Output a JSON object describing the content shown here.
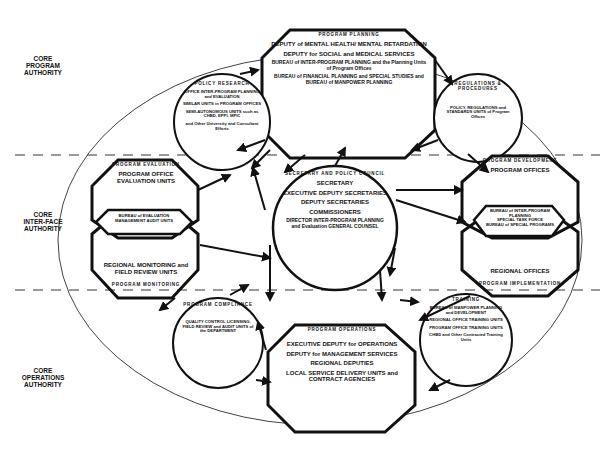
{
  "title": "",
  "zones": [
    {
      "label": "CORE\nPROGRAM\nAUTHORITY"
    },
    {
      "label": "CORE\nINTER-FACE\nAUTHORITY"
    },
    {
      "label": "CORE\nOPERATIONS\nAUTHORITY"
    }
  ],
  "nodes": {
    "program_planning": {
      "header": "PROGRAM PLANNING",
      "items": [
        "DEPUTY of MENTAL HEALTH/ MENTAL RETARDATION",
        "DEPUTY for SOCIAL and MEDICAL SERVICES",
        "BUREAU of INTER-PROGRAM PLANNING and the Planning Units of Program Offices",
        "BUREAU of FINANCIAL PLANNING and SPECIAL STUDIES and BUREAU of MANPOWER PLANNING"
      ]
    },
    "policy_research": {
      "header": "POLICY RESEARCH",
      "items": [
        "OFFICE INTER-PROGRAM PLANNING and EVALUATION",
        "SIMILAR UNITS in PROGRAM OFFICES",
        "SEMI-AUTONOMOUS UNITS such as CHBD, EPPI, MPIC",
        "and Other University and Consultant Efforts"
      ]
    },
    "regulations_procedures": {
      "header": "REGULATIONS & PROCEDURES",
      "items": [
        "POLICY, REGULATIONS and STANDARDS UNITS of Program Offices"
      ]
    },
    "program_evaluation": {
      "header": "PROGRAM EVALUATION",
      "items": [
        "PROGRAM OFFICE EVALUATION UNITS"
      ]
    },
    "bureau_evaluation": {
      "items": [
        "BUREAU of EVALUATION MANAGEMENT AUDIT UNITS"
      ]
    },
    "program_monitoring": {
      "header": "PROGRAM MONITORING",
      "items": [
        "REGIONAL MONITORING and FIELD REVIEW UNITS"
      ]
    },
    "secretary_policy_council": {
      "header": "SECRETARY AND POLICY COUNCIL",
      "items": [
        "SECRETARY",
        "EXECUTIVE DEPUTY SECRETARIES",
        "DEPUTY SECRETARIES",
        "COMMISSIONERS",
        "DIRECTOR INTER-PROGRAM PLANNING and Evaluation GENERAL COUNSEL"
      ]
    },
    "program_development": {
      "header": "PROGRAM DEVELOPMENT",
      "items": [
        "PROGRAM OFFICES"
      ]
    },
    "bureau_interprogram": {
      "items": [
        "BUREAU of INTER-PROGRAM PLANNING",
        "SPECIAL TASK FORCE",
        "BUREAU of SPECIAL PROGRAMS"
      ]
    },
    "program_implementation": {
      "header": "PROGRAM IMPLEMENTATION",
      "items": [
        "REGIONAL OFFICES"
      ]
    },
    "program_compliance": {
      "header": "PROGRAM COMPLIANCE",
      "items": [
        "QUALITY CONTROL LICENSING, FIELD REVIEW and AUDIT UNITS of the DEPARTMENT"
      ]
    },
    "program_operations": {
      "header": "PROGRAM OPERATIONS",
      "items": [
        "EXECUTIVE DEPUTY for OPERATIONS",
        "DEPUTY for MANAGEMENT SERVICES",
        "REGIONAL DEPUTIES",
        "LOCAL SERVICE DELIVERY UNITS and CONTRACT AGENCIES"
      ]
    },
    "training": {
      "header": "TRAINING",
      "items": [
        "BUREAU of MANPOWER PLANNING and DEVELOPMENT",
        "REGIONAL OFFICE TRAINING UNITS",
        "PROGRAM OFFICE TRAINING UNITS",
        "CHBD and Other Contracted Training Units"
      ]
    }
  }
}
